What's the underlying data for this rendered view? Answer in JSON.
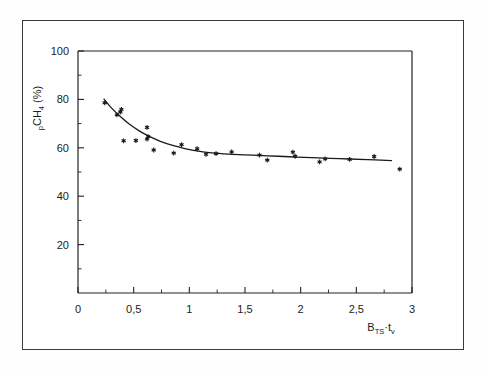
{
  "figure": {
    "background_color": "#ffffff",
    "frame_color": "#3a3a3a",
    "ink_color": "#1a1a1a"
  },
  "chart_data": {
    "type": "scatter",
    "title": "",
    "xlabel": "B_TS·t_v",
    "xlabel_parts": {
      "base1": "B",
      "sub1": "TS",
      "dot": "·",
      "base2": "t",
      "sub2": "v"
    },
    "ylabel": "p_CH4 (%)",
    "ylabel_parts": {
      "lead": "p",
      "sub": "CH",
      "sub_num": "4",
      "unit": "(%)"
    },
    "xlim": [
      0,
      3
    ],
    "ylim": [
      0,
      100
    ],
    "grid": false,
    "legend": null,
    "x_ticks": [
      0,
      0.5,
      1,
      1.5,
      2,
      2.5,
      3
    ],
    "x_tick_labels": [
      "0",
      "0,5",
      "1",
      "1,5",
      "2",
      "2,5",
      "3"
    ],
    "x_minor_step": 0.25,
    "y_ticks": [
      20,
      40,
      60,
      80,
      100
    ],
    "y_tick_labels": [
      "20",
      "40",
      "60",
      "80",
      "100"
    ],
    "y_minor_step": 10,
    "marker_style": "asterisk",
    "points": [
      {
        "x": 0.24,
        "y": 78.6
      },
      {
        "x": 0.35,
        "y": 73.6
      },
      {
        "x": 0.38,
        "y": 74.8
      },
      {
        "x": 0.39,
        "y": 75.9
      },
      {
        "x": 0.41,
        "y": 62.9
      },
      {
        "x": 0.52,
        "y": 63.0
      },
      {
        "x": 0.62,
        "y": 68.4
      },
      {
        "x": 0.62,
        "y": 63.6
      },
      {
        "x": 0.63,
        "y": 64.6
      },
      {
        "x": 0.68,
        "y": 59.1
      },
      {
        "x": 0.86,
        "y": 57.8
      },
      {
        "x": 0.93,
        "y": 61.3
      },
      {
        "x": 1.07,
        "y": 59.6
      },
      {
        "x": 1.15,
        "y": 57.3
      },
      {
        "x": 1.24,
        "y": 57.6
      },
      {
        "x": 1.38,
        "y": 58.3
      },
      {
        "x": 1.63,
        "y": 57.0
      },
      {
        "x": 1.7,
        "y": 54.9
      },
      {
        "x": 1.93,
        "y": 58.2
      },
      {
        "x": 1.95,
        "y": 56.5
      },
      {
        "x": 2.17,
        "y": 54.2
      },
      {
        "x": 2.22,
        "y": 55.4
      },
      {
        "x": 2.44,
        "y": 55.2
      },
      {
        "x": 2.66,
        "y": 56.4
      },
      {
        "x": 2.89,
        "y": 51.2
      }
    ],
    "fit_curve": {
      "name": "fitted trend",
      "points": [
        {
          "x": 0.23,
          "y": 80.3
        },
        {
          "x": 0.3,
          "y": 76.5
        },
        {
          "x": 0.38,
          "y": 72.9
        },
        {
          "x": 0.46,
          "y": 69.8
        },
        {
          "x": 0.55,
          "y": 67.0
        },
        {
          "x": 0.64,
          "y": 64.7
        },
        {
          "x": 0.74,
          "y": 62.7
        },
        {
          "x": 0.85,
          "y": 61.0
        },
        {
          "x": 0.96,
          "y": 59.7
        },
        {
          "x": 1.08,
          "y": 58.6
        },
        {
          "x": 1.2,
          "y": 57.9
        },
        {
          "x": 1.35,
          "y": 57.4
        },
        {
          "x": 1.5,
          "y": 57.1
        },
        {
          "x": 1.7,
          "y": 56.7
        },
        {
          "x": 1.9,
          "y": 56.3
        },
        {
          "x": 2.1,
          "y": 55.9
        },
        {
          "x": 2.35,
          "y": 55.5
        },
        {
          "x": 2.6,
          "y": 55.1
        },
        {
          "x": 2.82,
          "y": 54.7
        }
      ]
    }
  }
}
